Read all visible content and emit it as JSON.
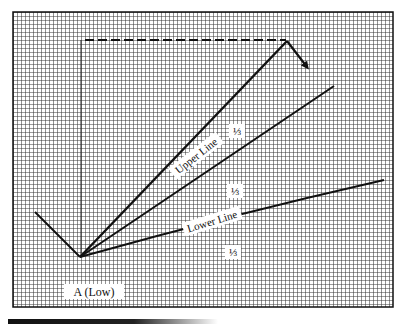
{
  "diagram": {
    "type": "speed-resistance-lines",
    "grid": {
      "enabled": true,
      "pitch_px": 4,
      "line_color": "#3a3a3a",
      "background": "#ffffff"
    },
    "frame": {
      "x": 13,
      "y": 12,
      "width": 380,
      "height": 295
    },
    "points": {
      "A": {
        "label": "A (Low)",
        "x": 80,
        "y": 257
      },
      "peak": {
        "x": 287,
        "y": 41
      },
      "prior_start": {
        "x": 35,
        "y": 212
      },
      "arrow_end": {
        "x": 309,
        "y": 70
      }
    },
    "lines": [
      {
        "name": "prior-decline",
        "from": [
          35,
          212
        ],
        "to": [
          80,
          257
        ],
        "style": "solid"
      },
      {
        "name": "main-advance",
        "from": [
          80,
          257
        ],
        "to": [
          287,
          41
        ],
        "style": "solid"
      },
      {
        "name": "reaction",
        "from": [
          287,
          41
        ],
        "to": [
          309,
          70
        ],
        "style": "arrow"
      },
      {
        "name": "upper-line",
        "label": "Upper Line",
        "from": [
          80,
          257
        ],
        "to": [
          334,
          86
        ],
        "style": "solid"
      },
      {
        "name": "lower-line",
        "label": "Lower Line",
        "from": [
          80,
          257
        ],
        "to": [
          384,
          180
        ],
        "style": "solid"
      },
      {
        "name": "height-vertical",
        "from": [
          81,
          40
        ],
        "to": [
          81,
          257
        ],
        "style": "thin"
      },
      {
        "name": "peak-horizontal",
        "from": [
          84,
          40
        ],
        "to": [
          287,
          40
        ],
        "style": "dashed"
      }
    ],
    "labels": {
      "upper_line": "Upper Line",
      "lower_line": "Lower Line",
      "point_a": "A (Low)",
      "third_1": "⅓",
      "third_2": "⅓",
      "third_3": "⅓"
    }
  }
}
